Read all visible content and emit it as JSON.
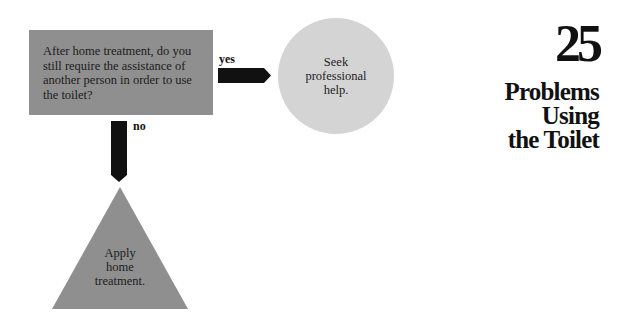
{
  "chapter": {
    "number": "25",
    "title_lines": [
      "Problems",
      "Using",
      "the Toilet"
    ]
  },
  "flowchart": {
    "question": {
      "shape": "rectangle",
      "color": "#8f8f8f",
      "text": "After home treatment, do you still require the assistance of another person in order to use the toilet?"
    },
    "yes_branch": {
      "label": "yes",
      "arrow": "right-arrow",
      "outcome": {
        "shape": "circle",
        "color": "#d4d4d4",
        "text_lines": [
          "Seek",
          "professional",
          "help."
        ]
      }
    },
    "no_branch": {
      "label": "no",
      "arrow": "down-arrow",
      "outcome": {
        "shape": "triangle",
        "color": "#8f8f8f",
        "text_lines": [
          "Apply",
          "home",
          "treatment."
        ]
      }
    }
  }
}
